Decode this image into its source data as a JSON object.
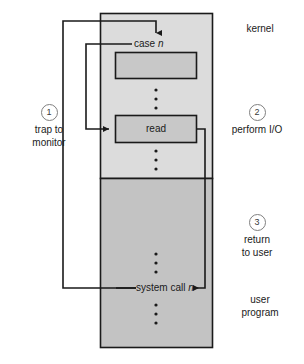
{
  "figure": {
    "type": "diagram"
  },
  "regions": {
    "kernel": {
      "label": "kernel",
      "fill": "#dcdcdc"
    },
    "user": {
      "label_line1": "user",
      "label_line2": "program",
      "fill": "#c3c3c3"
    }
  },
  "kernel_nodes": {
    "case_label_text": "case ",
    "case_label_var": "n",
    "read_box_label": "read",
    "empty_box_label": ""
  },
  "user_nodes": {
    "syscall_text": "system call ",
    "syscall_var": "n"
  },
  "steps": [
    {
      "number": "1",
      "line1": "trap to",
      "line2": "monitor"
    },
    {
      "number": "2",
      "line1": "perform I/O",
      "line2": ""
    },
    {
      "number": "3",
      "line1": "return",
      "line2": "to user"
    }
  ],
  "colors": {
    "kernel_fill": "#dcdcdc",
    "user_fill": "#c3c3c3",
    "box_fill": "#c8c8c8",
    "stroke": "#1a1a1a",
    "circle_stroke": "#808080",
    "background": "#ffffff"
  }
}
